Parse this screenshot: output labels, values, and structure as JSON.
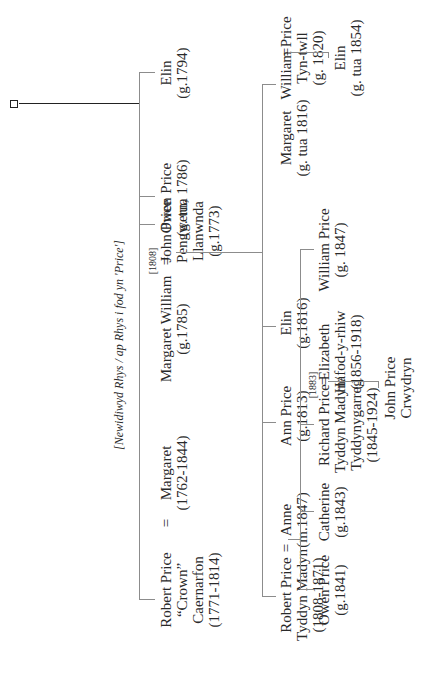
{
  "title_note": "[Newidiwyd Rhys / ap Rhys i fod yn 'Price']",
  "generation1": {
    "robert": {
      "lines": [
        "Robert Price",
        "“Crown”",
        "Caernarfon",
        "(1771-1814)"
      ]
    },
    "margaret": {
      "lines": [
        "Margaret",
        "(1762-1844)"
      ]
    },
    "john": {
      "lines": [
        "John Price",
        "Pengwern,",
        "Llanwnda",
        "(g.1773)"
      ]
    },
    "john_marriage_year": "[1808]",
    "margaret_william": {
      "lines": [
        "Margaret William",
        "(g.1785)"
      ]
    },
    "owen": {
      "lines": [
        "Owen Price",
        "(g. tua 1786)"
      ]
    },
    "elin": {
      "lines": [
        "Elin",
        "(g.1794)"
      ]
    }
  },
  "generation2": {
    "robert": {
      "lines": [
        "Robert Price",
        "Tyddyn Madyn",
        "(1808-1871)"
      ]
    },
    "anne": {
      "lines": [
        "Anne",
        "(m.1847)"
      ]
    },
    "ann": {
      "lines": [
        "Ann Price",
        "(g.1813)"
      ]
    },
    "elin": {
      "lines": [
        "Elin",
        "(g.1816)"
      ]
    },
    "margaret": {
      "lines": [
        "Margaret",
        "(g. tua 1816)"
      ]
    },
    "william": {
      "lines": [
        "William Price",
        "Tyn-twll",
        "(g. 1820)"
      ]
    }
  },
  "generation3": {
    "owen": {
      "lines": [
        "Owen Price",
        "(g.1841)"
      ]
    },
    "catherine": {
      "lines": [
        "Catherine",
        "(g.1843)"
      ]
    },
    "richard": {
      "lines": [
        "Richard Price",
        "Tyddyn Madyn/",
        "Tyddynygarreg",
        "(1845-1924)"
      ]
    },
    "richard_marriage_year": "[1883]",
    "elizabeth": {
      "lines": [
        "Elizabeth",
        "Hafod-y-rhiw",
        "(1856-1918)"
      ]
    },
    "william": {
      "lines": [
        "William Price",
        "(g. 1847)"
      ]
    },
    "elin": {
      "lines": [
        "Elin",
        "(g. tua 1854)"
      ]
    }
  },
  "generation4": {
    "john": {
      "lines": [
        "John Price",
        "Crwydryn"
      ]
    }
  },
  "symbols": {
    "marriage": "="
  },
  "colors": {
    "line": "#8c8c8c",
    "root_line": "#222222",
    "text": "#2a2a2a"
  }
}
